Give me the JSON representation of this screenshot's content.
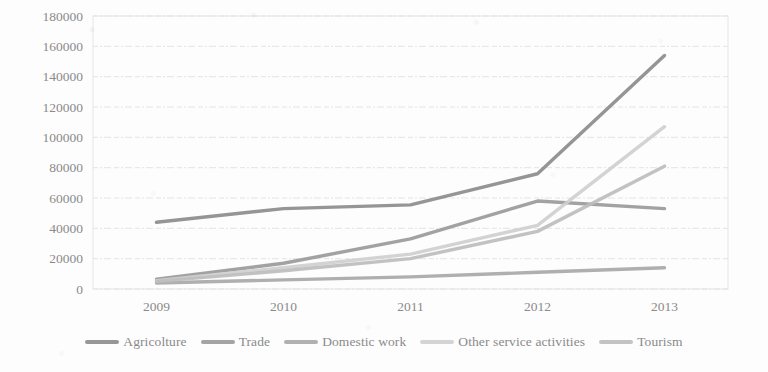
{
  "chart_data": {
    "type": "line",
    "title": "",
    "subtitle": "",
    "xlabel": "",
    "ylabel": "",
    "categories": [
      "2009",
      "2010",
      "2011",
      "2012",
      "2013"
    ],
    "x_tick_labels": [
      "2009",
      "2010",
      "2011",
      "2012",
      "2013"
    ],
    "y_tick_labels": [
      "0",
      "20000",
      "40000",
      "60000",
      "80000",
      "100000",
      "120000",
      "140000",
      "160000",
      "180000"
    ],
    "ylim": [
      0,
      180000
    ],
    "y_tick_step": 20000,
    "grid": "horizontal",
    "legend_position": "bottom",
    "series": [
      {
        "name": "Agricolture",
        "color": "#8c8c8c",
        "values": [
          44000,
          53000,
          55500,
          76000,
          154000
        ]
      },
      {
        "name": "Trade",
        "color": "#9a9a9a",
        "values": [
          6500,
          17000,
          33000,
          58000,
          53000
        ]
      },
      {
        "name": "Domestic work",
        "color": "#a8a8a8",
        "values": [
          4000,
          6000,
          8000,
          11000,
          14000
        ]
      },
      {
        "name": "Other service activities",
        "color": "#cfcfcf",
        "values": [
          5500,
          14000,
          23000,
          42000,
          107000
        ]
      },
      {
        "name": "Tourism",
        "color": "#bdbdbd",
        "values": [
          5000,
          12000,
          20000,
          38000,
          81000
        ]
      }
    ]
  },
  "legend": {
    "items": [
      {
        "label": "Agricolture"
      },
      {
        "label": "Trade"
      },
      {
        "label": "Domestic work"
      },
      {
        "label": "Other service activities"
      },
      {
        "label": "Tourism"
      }
    ]
  }
}
